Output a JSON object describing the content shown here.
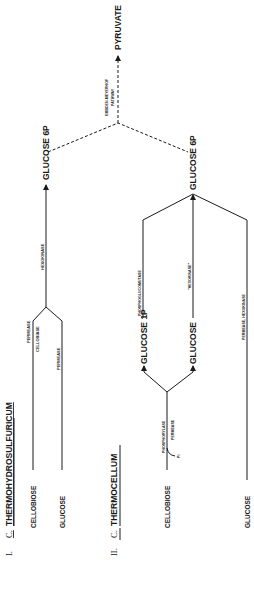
{
  "diagram": {
    "section_1": {
      "numeral": "I.",
      "genus": "C.",
      "species": "THERMOHYDROSULFURICUM",
      "substrates": [
        "CELLOBIOSE",
        "GLUCOSE"
      ],
      "enzymes": {
        "cellobiose_permease": "PERMEASE",
        "cellobiase": "CELLOBIASE",
        "glucose_permease": "PERMEASE",
        "hexokinase": "HEXOKINASE"
      },
      "product": "GLUCOSE 6P"
    },
    "section_2": {
      "numeral": "II.",
      "genus": "C.",
      "species": "THERMOCELLUM",
      "substrates": [
        "CELLOBIOSE",
        "GLUCOSE"
      ],
      "enzymes": {
        "phosphorylase": "PHOSPHORYLASE",
        "permease": "PERMEASE",
        "pi": "Pi",
        "phosphoglucomutase": "PHOSPHOGLUCOMUTASE",
        "hexokinase_quoted": "\"HEXOKINASE\"",
        "permease_hexokinase": "PERMEASE, HEXOKINASE"
      },
      "intermediates": [
        "GLUCOSE 1P",
        "GLUCOSE"
      ],
      "product": "GLUCOSE 6P"
    },
    "shared": {
      "pathway_line1": "EMBDEN-MEYERHOF",
      "pathway_line2": "PATHWAY",
      "end_product": "PYRUVATE"
    },
    "colors": {
      "ink": "#1a1a1a",
      "background": "#ffffff"
    }
  }
}
